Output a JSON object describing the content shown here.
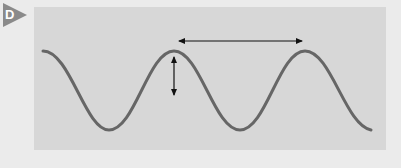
{
  "figure": {
    "label": "D",
    "badge_color": "#8a8a8a",
    "panel_color": "#d7d7d7",
    "wave_color": "#666666",
    "arrow_color": "#111111"
  },
  "diagram": {
    "type": "sine-wave",
    "cycles_visible": 2.5,
    "annotations": [
      {
        "kind": "horizontal-double-arrow",
        "meaning": "wavelength (peak to peak)"
      },
      {
        "kind": "vertical-double-arrow",
        "meaning": "amplitude (from crest downward)"
      }
    ]
  }
}
